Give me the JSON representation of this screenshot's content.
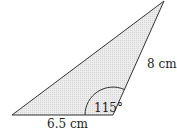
{
  "diagram": {
    "type": "triangle",
    "vertices": {
      "left": [
        12,
        115
      ],
      "right": [
        113,
        115
      ],
      "top": [
        164,
        1
      ]
    },
    "fill_color": "#e6e6e6",
    "stroke_color": "#333333",
    "labels": {
      "base_length": "6.5 cm",
      "side_length": "8 cm",
      "angle": "115°"
    }
  }
}
